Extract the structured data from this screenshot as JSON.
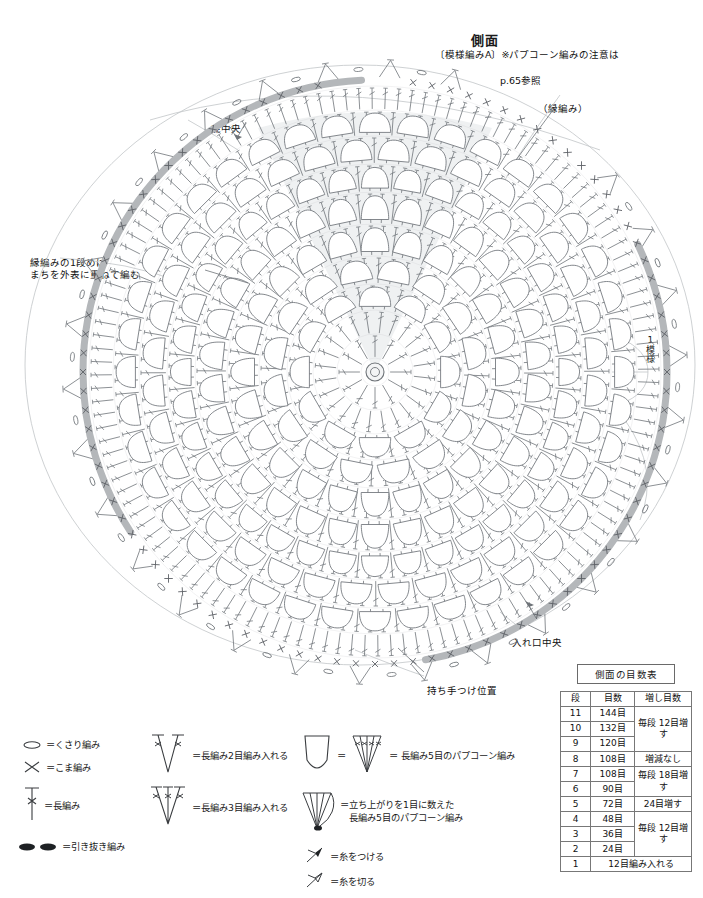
{
  "header": {
    "title": "側面",
    "subtitle_left": "〔模様編みA〕",
    "subtitle_right": "※パプコーン編みの注意は",
    "subtitle_line2": "p.65参照"
  },
  "annotations": {
    "edge_knit": "（縁編み）",
    "bottom_center": "底中央",
    "left_note": "縁編みの1段めは\nまちを外表に重ねて編む",
    "right_vertical": "1模様",
    "opening_center": "入れ口中央",
    "handle_position": "持ち手つけ位置"
  },
  "table": {
    "caption": "側面の目数表",
    "headers": [
      "段",
      "目数",
      "増し目数"
    ],
    "rows": [
      {
        "row": "11",
        "stitches": "144目"
      },
      {
        "row": "10",
        "stitches": "132目"
      },
      {
        "row": "9",
        "stitches": "120目"
      },
      {
        "row": "8",
        "stitches": "108目"
      },
      {
        "row": "7",
        "stitches": "108目"
      },
      {
        "row": "6",
        "stitches": "90目"
      },
      {
        "row": "5",
        "stitches": "72目"
      },
      {
        "row": "4",
        "stitches": "48目"
      },
      {
        "row": "3",
        "stitches": "36目"
      },
      {
        "row": "2",
        "stitches": "24目"
      },
      {
        "row": "1",
        "stitches": "12目編み入れる"
      }
    ],
    "increase_groups": {
      "g1": "毎段\n12目増す",
      "g2": "増減なし",
      "g3": "毎段\n18目増す",
      "g4": "24目増す",
      "g5": "毎段\n12目増す"
    }
  },
  "legend": {
    "items": [
      {
        "icon": "chain-stitch-icon",
        "label": "＝くさり編み"
      },
      {
        "icon": "single-crochet-icon",
        "label": "＝こま編み"
      },
      {
        "icon": "double-crochet-icon",
        "label": "＝長編み"
      },
      {
        "icon": "slip-stitch-icon",
        "label": "＝引き抜き編み"
      },
      {
        "icon": "dc2tog-increase-icon",
        "label": "＝長編み2目編み入れる"
      },
      {
        "icon": "dc3tog-increase-icon",
        "label": "＝長編み3目編み入れる"
      },
      {
        "icon": "popcorn-icon",
        "label": "＝ 長編み5目のパプコーン編み"
      },
      {
        "icon": "popcorn-turning-icon",
        "label": "＝立ち上がりを1目に数えた\n　長編み5目のパプコーン編み"
      },
      {
        "icon": "attach-yarn-icon",
        "label": "＝糸をつける"
      },
      {
        "icon": "cut-yarn-icon",
        "label": "＝糸を切る"
      }
    ],
    "popcorn_equals": "＝"
  },
  "colors": {
    "stitch_line": "#6e7378",
    "edge_band": "#b4b7ba",
    "shade_fill": "#eceef0",
    "guide_line": "#b9bcbf",
    "table_border": "#777777",
    "text": "#111111"
  },
  "chart_data": {
    "type": "diagram",
    "center": {
      "x": 375,
      "y": 372
    },
    "rounds": 11,
    "round_radii": [
      14,
      38,
      62,
      88,
      116,
      148,
      180,
      208,
      236,
      262,
      286
    ],
    "round_stitch_counts": [
      12,
      24,
      36,
      48,
      72,
      90,
      108,
      108,
      120,
      132,
      144
    ],
    "popcorn_rings": [
      3,
      4,
      5,
      6,
      7,
      8,
      9
    ],
    "edge_band_radius": 292,
    "edge_band_arc_deg": [
      118,
      430
    ],
    "shaded_wedge_deg": [
      250,
      290
    ]
  }
}
